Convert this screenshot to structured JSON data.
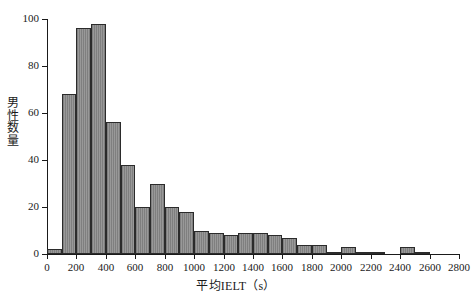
{
  "chart_data": {
    "type": "bar",
    "subtype": "histogram",
    "title": "",
    "xlabel": "平均IELT（s）",
    "ylabel": "男性数量",
    "xlim": [
      0,
      2800
    ],
    "ylim": [
      0,
      100
    ],
    "bin_width": 100,
    "grid": false,
    "legend": null,
    "xticks": [
      0,
      200,
      400,
      600,
      800,
      1000,
      1200,
      1400,
      1600,
      1800,
      2000,
      2200,
      2400,
      2600,
      2800
    ],
    "xtick_labels": [
      "0",
      "200",
      "400",
      "600",
      "800",
      "1000",
      "1200",
      "1400",
      "1600",
      "1800",
      "2000",
      "2200",
      "2400",
      "2600",
      "2800"
    ],
    "yticks": [
      0,
      20,
      40,
      60,
      80,
      100
    ],
    "ytick_labels": [
      "0",
      "20",
      "40",
      "60",
      "80",
      "100"
    ],
    "bin_starts": [
      0,
      100,
      200,
      300,
      400,
      500,
      600,
      700,
      800,
      900,
      1000,
      1100,
      1200,
      1300,
      1400,
      1500,
      1600,
      1700,
      1800,
      1900,
      2000,
      2100,
      2200,
      2300,
      2400,
      2500,
      2600,
      2700
    ],
    "values": [
      2,
      68,
      96,
      98,
      56,
      38,
      20,
      30,
      20,
      18,
      10,
      9,
      8,
      9,
      9,
      8,
      7,
      4,
      4,
      1,
      3,
      1,
      1,
      0,
      3,
      1,
      0,
      0
    ],
    "bar_color": "#8d8d8d",
    "bar_edge_color": "#2b2b2b",
    "axis_color": "#1a1a1a",
    "background_color": "#ffffff"
  }
}
